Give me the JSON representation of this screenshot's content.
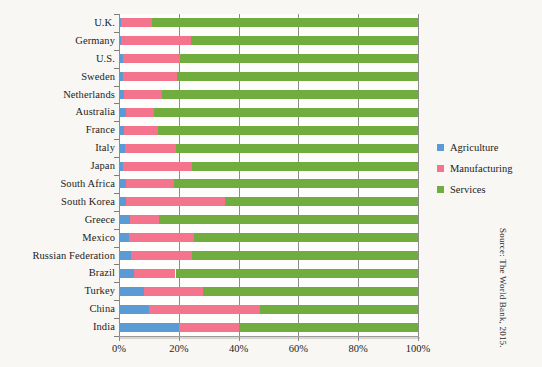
{
  "colors": {
    "agriculture": "#5B9BD5",
    "manufacturing": "#F4748E",
    "services": "#70AD3E",
    "gridline": "#8d8d8d",
    "background": "#f8f7f3",
    "plot_background": "#fdfdfb",
    "text": "#1c1c1c"
  },
  "source_note": "Source: The World Bank, 2015.",
  "legend": {
    "position": "right",
    "items": [
      {
        "label": "Agriculture",
        "color": "#5B9BD5",
        "swatch_name": "legend-swatch-agriculture"
      },
      {
        "label": "Manufacturing",
        "color": "#F4748E",
        "swatch_name": "legend-swatch-manufacturing"
      },
      {
        "label": "Services",
        "color": "#70AD3E",
        "swatch_name": "legend-swatch-services"
      }
    ]
  },
  "chart_data": {
    "type": "bar",
    "orientation": "horizontal",
    "stacked": true,
    "normalized": true,
    "title": "",
    "subtitle": "",
    "xlabel": "",
    "ylabel": "",
    "xlim": [
      0,
      100
    ],
    "xticks": [
      0,
      20,
      40,
      60,
      80,
      100
    ],
    "xtick_labels": [
      "0%",
      "20%",
      "40%",
      "60%",
      "80%",
      "100%"
    ],
    "grid": true,
    "grid_axis": "x",
    "legend_position": "right",
    "categories": [
      "U.K.",
      "Germany",
      "U.S.",
      "Sweden",
      "Netherlands",
      "Australia",
      "France",
      "Italy",
      "Japan",
      "South Africa",
      "South Korea",
      "Greece",
      "Mexico",
      "Russian Federation",
      "Brazil",
      "Turkey",
      "China",
      "India"
    ],
    "series": [
      {
        "name": "Agriculture",
        "color": "#5B9BD5",
        "values": [
          0.6,
          0.7,
          1.2,
          1.4,
          1.6,
          2.4,
          1.7,
          2.0,
          1.2,
          2.5,
          2.3,
          3.6,
          3.5,
          4.0,
          5.0,
          8.5,
          10.0,
          20.0
        ]
      },
      {
        "name": "Manufacturing",
        "color": "#F4748E",
        "values": [
          10.4,
          23.3,
          19.3,
          18.1,
          12.9,
          9.4,
          11.3,
          17.0,
          23.3,
          16.0,
          33.2,
          9.9,
          21.5,
          20.5,
          13.9,
          19.5,
          37.0,
          20.0
        ]
      },
      {
        "name": "Services",
        "color": "#70AD3E",
        "values": [
          89.0,
          76.0,
          79.5,
          80.5,
          85.5,
          88.2,
          87.0,
          81.0,
          75.5,
          81.5,
          64.5,
          86.5,
          75.0,
          75.5,
          81.1,
          72.0,
          53.0,
          60.0
        ]
      }
    ]
  }
}
